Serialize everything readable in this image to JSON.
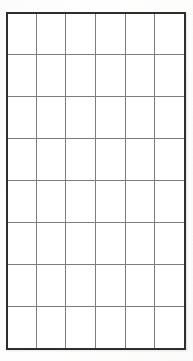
{
  "document": {
    "kind": "blank-grid-table",
    "description": "Scanned blank ruled grid table with empty cells",
    "cell_text": ""
  },
  "grid": {
    "columns": 6,
    "rows": 8,
    "total_cells": 48,
    "column_labels": [
      "1",
      "2",
      "3",
      "4",
      "5",
      "6"
    ],
    "row_labels": [
      "1",
      "2",
      "3",
      "4",
      "5",
      "6",
      "7",
      "8"
    ],
    "cells": [
      [
        "",
        "",
        "",
        "",
        "",
        ""
      ],
      [
        "",
        "",
        "",
        "",
        "",
        ""
      ],
      [
        "",
        "",
        "",
        "",
        "",
        ""
      ],
      [
        "",
        "",
        "",
        "",
        "",
        ""
      ],
      [
        "",
        "",
        "",
        "",
        "",
        ""
      ],
      [
        "",
        "",
        "",
        "",
        "",
        ""
      ],
      [
        "",
        "",
        "",
        "",
        "",
        ""
      ],
      [
        "",
        "",
        "",
        "",
        "",
        ""
      ]
    ]
  },
  "geometry": {
    "image_width": 193,
    "image_height": 361,
    "table_left": 7,
    "table_top": 13,
    "table_width": 178,
    "table_height": 336,
    "column_width": 29.7,
    "row_height": 42.0,
    "vertical_line_x": [
      7,
      37,
      67,
      96,
      126,
      156,
      185
    ],
    "horizontal_line_y": [
      13,
      55,
      97,
      139,
      181,
      223,
      265,
      307,
      349
    ]
  },
  "colors": {
    "page_background": "#fdfdfd",
    "cell_background": "#ffffff",
    "inner_rule": "#7c7c7c",
    "outer_frame": "#2e2e2e"
  },
  "strokes": {
    "outer_frame_width_px": 2,
    "inner_rule_width_px": 1
  }
}
